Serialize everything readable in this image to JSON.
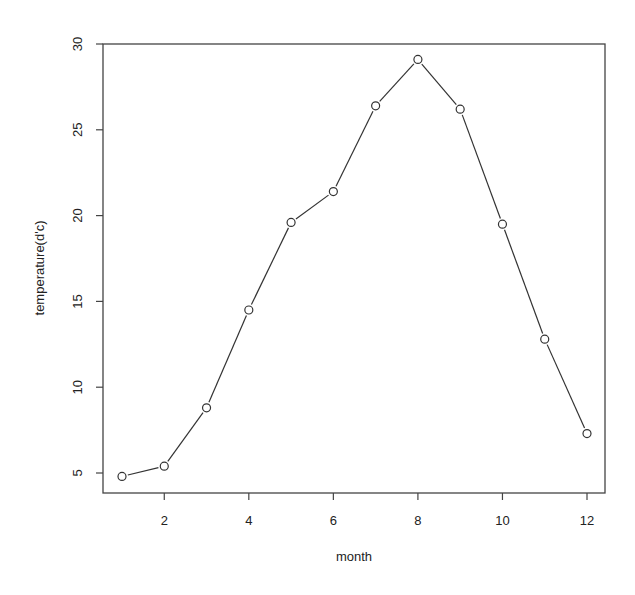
{
  "chart_data": {
    "type": "line",
    "title": "",
    "xlabel": "month",
    "ylabel": "temperature(d'c)",
    "x": [
      1,
      2,
      3,
      4,
      5,
      6,
      7,
      8,
      9,
      10,
      11,
      12
    ],
    "series": [
      {
        "name": "temperature",
        "values": [
          4.8,
          5.4,
          8.8,
          14.5,
          19.6,
          21.4,
          26.4,
          29.1,
          26.2,
          19.5,
          12.8,
          7.3
        ]
      }
    ],
    "xticks": [
      2,
      4,
      6,
      8,
      10,
      12
    ],
    "yticks": [
      5,
      10,
      15,
      20,
      25,
      30
    ],
    "xlim": [
      0.55,
      12.45
    ],
    "ylim": [
      3.85,
      30
    ],
    "grid": false,
    "marker": "open-circle",
    "line_color": "#333333"
  }
}
